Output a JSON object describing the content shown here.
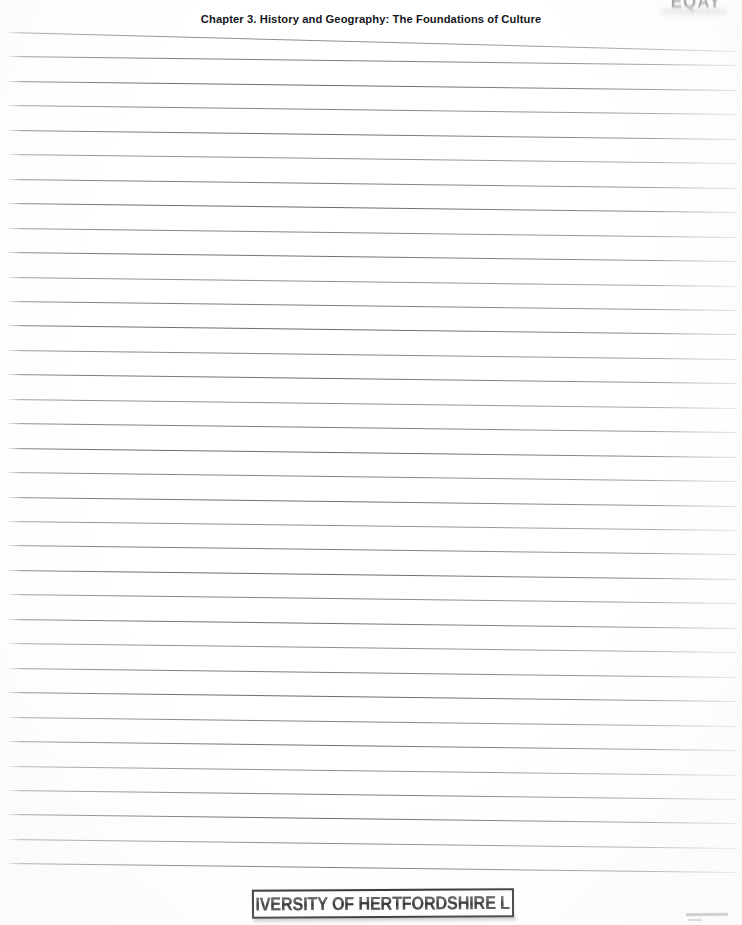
{
  "page": {
    "width": 742,
    "height": 925,
    "background_color": "#ffffff",
    "kind": "scanned-ruled-notebook-page"
  },
  "header": {
    "title": "Chapter 3. History and Geography: The Foundations of Culture"
  },
  "corner_stamp": {
    "text": "EQAY",
    "note": "faint smudged stamp, cropped by top page edge",
    "color": "#4a4a4c"
  },
  "library_stamp": {
    "text": "UNIVERSITY OF HERTFORDSHIRE LRC",
    "border_color": "#1d1d1f",
    "text_color": "#121214",
    "left": 252,
    "top": 889,
    "width": 262,
    "height": 29
  },
  "ruled_lines": {
    "color": "#5e5e62",
    "count": 35,
    "first_line_y": 32,
    "spacing": 24.45,
    "left": 8,
    "right": 737,
    "tilt_drop_px": 9,
    "top_rule_tilt_drop_px": 19
  }
}
